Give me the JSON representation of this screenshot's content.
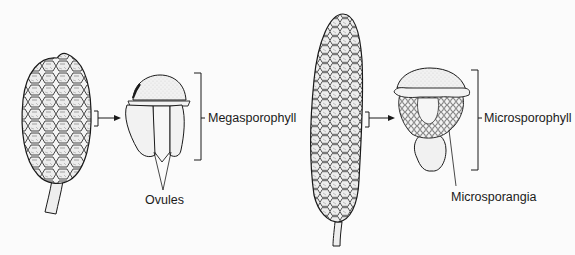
{
  "figure": {
    "left_panel": {
      "subject": "ovulate cone",
      "labels": {
        "sporophyll": "Megasporophyll",
        "part": "Ovules"
      }
    },
    "right_panel": {
      "subject": "pollen cone",
      "labels": {
        "sporophyll": "Microsporophyll",
        "part": "Microsporangia"
      }
    },
    "colors": {
      "ink": "#1a1a1a",
      "background": "#fbfbfb",
      "shade": "#d9d9d9"
    }
  }
}
